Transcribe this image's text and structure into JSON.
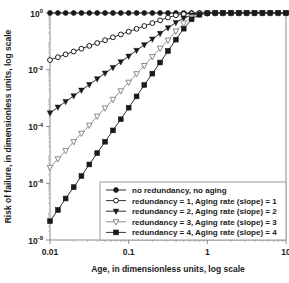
{
  "chart_data": {
    "type": "line",
    "title": "",
    "subtitle": "",
    "xlabel": "Age, in dimensionless units, log scale",
    "ylabel": "Risk of failure, in dimensionless units, log scale",
    "xscale": "log",
    "yscale": "log",
    "xlim": [
      0.01,
      10
    ],
    "ylim": [
      1e-08,
      1
    ],
    "grid": false,
    "legend_position": "lower-right",
    "xticks": [
      0.01,
      0.1,
      1,
      10
    ],
    "xticklabels": [
      "0.01",
      "0.1",
      "1",
      "10"
    ],
    "yticks": [
      1,
      0.01,
      0.0001,
      1e-06,
      1e-08
    ],
    "yticklabels": [
      "10",
      "10",
      "10",
      "10",
      "10"
    ],
    "yticklabel_exponents": [
      "0",
      "-2",
      "-4",
      "-6",
      "-8"
    ],
    "series": [
      {
        "name": "no redundancy, no aging",
        "marker": "filled-circle",
        "color": "#1a1a1a",
        "slope": 0,
        "redundancy": 0,
        "aging_rate": 0,
        "x": [
          0.01,
          0.0126,
          0.0158,
          0.02,
          0.0251,
          0.0316,
          0.0398,
          0.0501,
          0.0631,
          0.0794,
          0.1,
          0.126,
          0.158,
          0.2,
          0.251,
          0.316,
          0.398,
          0.501,
          0.631,
          0.794,
          1.0,
          1.26,
          1.58,
          2.0,
          2.51,
          3.16,
          3.98,
          5.01,
          6.31,
          7.94,
          10.0
        ],
        "y": [
          1,
          1,
          1,
          1,
          1,
          1,
          1,
          1,
          1,
          1,
          1,
          1,
          1,
          1,
          1,
          1,
          1,
          1,
          1,
          1,
          1,
          1,
          1,
          1,
          1,
          1,
          1,
          1,
          1,
          1,
          1
        ]
      },
      {
        "name": "redundancy = 1, Aging rate (slope) = 1",
        "marker": "open-circle",
        "color": "#1a1a1a",
        "slope": 1,
        "redundancy": 1,
        "aging_rate": 1,
        "x": [
          0.01,
          0.0126,
          0.0158,
          0.02,
          0.0251,
          0.0316,
          0.0398,
          0.0501,
          0.0631,
          0.0794,
          0.1,
          0.126,
          0.158,
          0.2,
          0.251,
          0.316,
          0.398,
          0.501,
          0.631,
          0.794,
          1.0,
          1.26,
          1.58,
          2.0,
          2.51,
          3.16,
          3.98,
          5.01,
          6.31,
          7.94,
          10.0
        ],
        "y": [
          0.022,
          0.0277,
          0.0348,
          0.044,
          0.0552,
          0.0695,
          0.0875,
          0.11,
          0.139,
          0.175,
          0.22,
          0.277,
          0.348,
          0.44,
          0.552,
          0.695,
          0.83,
          0.91,
          0.96,
          0.985,
          0.995,
          0.999,
          1,
          1,
          1,
          1,
          1,
          1,
          1,
          1,
          1
        ]
      },
      {
        "name": "redundancy = 2, Aging rate (slope) = 2",
        "marker": "filled-triangle-down",
        "color": "#1a1a1a",
        "slope": 2,
        "redundancy": 2,
        "aging_rate": 2,
        "x": [
          0.01,
          0.0126,
          0.0158,
          0.02,
          0.0251,
          0.0316,
          0.0398,
          0.0501,
          0.0631,
          0.0794,
          0.1,
          0.126,
          0.158,
          0.2,
          0.251,
          0.316,
          0.398,
          0.501,
          0.631,
          0.794,
          1.0,
          1.26,
          1.58,
          2.0,
          2.51,
          3.16,
          3.98,
          5.01,
          6.31,
          7.94,
          10.0
        ],
        "y": [
          0.0003,
          0.00048,
          0.00076,
          0.0012,
          0.0019,
          0.003,
          0.0048,
          0.0076,
          0.012,
          0.019,
          0.03,
          0.048,
          0.076,
          0.12,
          0.19,
          0.3,
          0.46,
          0.66,
          0.84,
          0.95,
          0.99,
          0.999,
          1,
          1,
          1,
          1,
          1,
          1,
          1,
          1,
          1
        ]
      },
      {
        "name": "redundancy = 3, Aging rate (slope) = 3",
        "marker": "open-triangle-down",
        "color": "#8a8a8a",
        "slope": 3,
        "redundancy": 3,
        "aging_rate": 3,
        "x": [
          0.01,
          0.0126,
          0.0158,
          0.02,
          0.0251,
          0.0316,
          0.0398,
          0.0501,
          0.0631,
          0.0794,
          0.1,
          0.126,
          0.158,
          0.2,
          0.251,
          0.316,
          0.398,
          0.501,
          0.631,
          0.794,
          1.0,
          1.26,
          1.58,
          2.0,
          2.51,
          3.16,
          3.98,
          5.01,
          6.31,
          7.94,
          10.0
        ],
        "y": [
          3.6e-06,
          7.2e-06,
          1.4e-05,
          2.9e-05,
          5.7e-05,
          0.00011,
          0.00023,
          0.00045,
          0.0009,
          0.0018,
          0.0036,
          0.0072,
          0.014,
          0.029,
          0.057,
          0.11,
          0.23,
          0.44,
          0.71,
          0.9,
          0.975,
          0.997,
          1,
          1,
          1,
          1,
          1,
          1,
          1,
          1,
          1
        ]
      },
      {
        "name": "redundancy = 4, Aging rate (slope) = 4",
        "marker": "filled-square",
        "color": "#1a1a1a",
        "slope": 4,
        "redundancy": 4,
        "aging_rate": 4,
        "x": [
          0.01,
          0.0126,
          0.0158,
          0.02,
          0.0251,
          0.0316,
          0.0398,
          0.0501,
          0.0631,
          0.0794,
          0.1,
          0.126,
          0.158,
          0.2,
          0.251,
          0.316,
          0.398,
          0.501,
          0.631,
          0.794,
          1.0,
          1.26,
          1.58,
          2.0,
          2.51,
          3.16,
          3.98,
          5.01,
          6.31,
          7.94,
          10.0
        ],
        "y": [
          4.6e-08,
          1.15e-07,
          2.9e-07,
          7.3e-07,
          1.8e-06,
          4.6e-06,
          1.15e-05,
          2.9e-05,
          7.3e-05,
          0.00018,
          0.00046,
          0.00115,
          0.0029,
          0.0073,
          0.018,
          0.046,
          0.115,
          0.28,
          0.6,
          0.87,
          0.97,
          0.996,
          1,
          1,
          1,
          1,
          1,
          1,
          1,
          1,
          1
        ]
      }
    ],
    "legend_entries": [
      "no redundancy, no aging",
      "redundancy = 1, Aging rate (slope) = 1",
      "redundancy = 2, Aging rate (slope) = 2",
      "redundancy = 3, Aging rate (slope) = 3",
      "redundancy = 4, Aging rate (slope) = 4"
    ]
  }
}
